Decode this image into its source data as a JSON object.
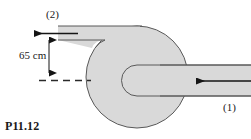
{
  "figure": {
    "number": "P11.12",
    "type": "fluid-machine-cross-section"
  },
  "labels": {
    "outlet_port": "(2)",
    "inlet_port": "(1)",
    "dimension": "65 cm",
    "figure_number": "P11.12"
  },
  "geometry": {
    "canvas_width": 251,
    "canvas_height": 139,
    "circle": {
      "cx": 137,
      "cy": 77,
      "r": 51
    },
    "outlet_pipe": {
      "top_y": 26,
      "bottom_y": 40,
      "left_x": 58,
      "right_x": 140
    },
    "inlet_pipe": {
      "top_y": 65,
      "bottom_y": 96,
      "left_x": 122,
      "right_x": 251
    },
    "u_bend": {
      "left_x": 121,
      "radius": 15.5
    },
    "centerline_y": 80,
    "dimension_line_x": 49,
    "dimension_from_y": 33,
    "dimension_to_y": 80
  },
  "colors": {
    "fill_gray": "#d6d6d6",
    "fill_gray_light": "#dedede",
    "outline": "#555555",
    "arrow": "#151515",
    "text": "#1a1a1a",
    "background": "#ffffff",
    "dashed": "#2a2a2a"
  },
  "arrows": {
    "outlet_flow": {
      "name": "outlet-flow-arrow",
      "direction": "left",
      "from_x": 76,
      "to_x": 31,
      "y": 33
    },
    "inlet_flow": {
      "name": "inlet-flow-arrow",
      "direction": "left",
      "from_x": 251,
      "to_x": 192,
      "y": 81
    },
    "dimension_up": {
      "name": "dimension-arrow-up",
      "direction": "up"
    },
    "dimension_down": {
      "name": "dimension-arrow-down",
      "direction": "down"
    }
  }
}
